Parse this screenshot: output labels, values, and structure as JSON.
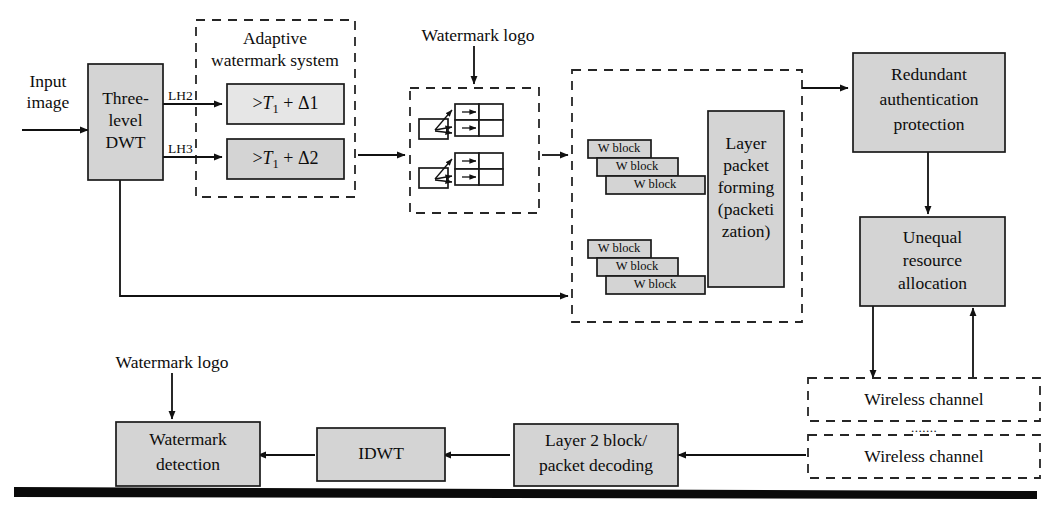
{
  "figure": {
    "colors": {
      "node_fill": "#d4d4d4",
      "node_fill_light": "#e6e6e6",
      "stroke": "#1a1a1a",
      "background": "#ffffff"
    }
  },
  "free_labels": {
    "input_image_line1": "Input",
    "input_image_line2": "image",
    "lh2": "LH2",
    "lh3": "LH3",
    "watermark_logo_top": "Watermark logo",
    "watermark_logo_bottom": "Watermark logo",
    "channel_ellipsis": "......."
  },
  "group_boxes": [
    {
      "id": "adaptive-watermark-system",
      "title_line1": "Adaptive",
      "title_line2": "watermark system",
      "style": "dashed"
    },
    {
      "id": "watermark-logo-group",
      "title_line1": "",
      "title_line2": "",
      "style": "dashed"
    },
    {
      "id": "layer-packet-group",
      "title_line1": "",
      "title_line2": "",
      "style": "dashed"
    }
  ],
  "nodes": {
    "dwt": {
      "lines": [
        "Three-",
        "level",
        "DWT"
      ]
    },
    "threshold1": {
      "prefix": ">",
      "symbol": "T",
      "subscript": "1",
      "plus": "+",
      "delta": "Δ1",
      "full": ">T1 + Δ1"
    },
    "threshold2": {
      "prefix": ">",
      "symbol": "T",
      "subscript": "1",
      "plus": "+",
      "delta": "Δ2",
      "full": ">T1 + Δ2"
    },
    "wblocks_upper": [
      "W block",
      "W block",
      "W block"
    ],
    "wblocks_lower": [
      "W block",
      "W block",
      "W block"
    ],
    "layer_packet_forming": {
      "lines": [
        "Layer",
        "packet",
        "forming",
        "(packeti",
        "zation)"
      ]
    },
    "redundant_auth": {
      "lines": [
        "Redundant",
        "authentication",
        "protection"
      ]
    },
    "unequal_alloc": {
      "lines": [
        "Unequal",
        "resource",
        "allocation"
      ]
    },
    "wireless_channel_1": {
      "label": "Wireless channel"
    },
    "wireless_channel_2": {
      "label": "Wireless channel"
    },
    "layer2_decoding": {
      "lines": [
        "Layer 2 block/",
        "packet decoding"
      ]
    },
    "idwt": {
      "label": "IDWT"
    },
    "watermark_detection": {
      "lines": [
        "Watermark",
        "detection"
      ]
    }
  }
}
